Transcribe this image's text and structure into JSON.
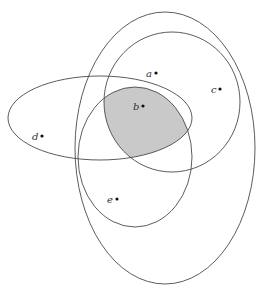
{
  "diagram": {
    "type": "venn",
    "colors": {
      "stroke": "#4a4a4a",
      "shaded_region": "#c9c9c9",
      "point": "#111111"
    },
    "sets": [
      {
        "id": "outer-ellipse",
        "cx": 165,
        "cy": 148,
        "rx": 90,
        "ry": 136
      },
      {
        "id": "inner-upper-ellipse",
        "cx": 172,
        "cy": 102,
        "rx": 68,
        "ry": 70
      },
      {
        "id": "left-ellipse",
        "cx": 100,
        "cy": 118,
        "rx": 92,
        "ry": 42
      },
      {
        "id": "middle-ellipse",
        "cx": 135,
        "cy": 157,
        "rx": 57,
        "ry": 70
      }
    ],
    "shaded": "intersection of inner-upper-ellipse, left-ellipse and middle-ellipse",
    "points": [
      {
        "label": "a",
        "x": 156,
        "y": 73
      },
      {
        "label": "b",
        "x": 143,
        "y": 106
      },
      {
        "label": "c",
        "x": 220,
        "y": 89
      },
      {
        "label": "d",
        "x": 42,
        "y": 136
      },
      {
        "label": "e",
        "x": 117,
        "y": 199
      }
    ]
  }
}
